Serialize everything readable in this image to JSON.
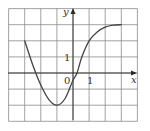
{
  "chart_data": {
    "type": "line",
    "title": "",
    "xlabel": "x",
    "ylabel": "y",
    "tick_labels": {
      "origin": "0",
      "x": [
        "1"
      ],
      "y": [
        "1"
      ]
    },
    "xlim": [
      -4,
      4
    ],
    "ylim": [
      -3,
      4
    ],
    "grid": true,
    "grid_step": 1,
    "legend": null,
    "series": [
      {
        "name": "f(x)",
        "x": [
          -3,
          -2.5,
          -2,
          -1.5,
          -1,
          -0.5,
          0,
          0.25,
          0.55,
          1,
          1.5,
          2,
          2.5,
          3
        ],
        "y": [
          2,
          0.5,
          -0.75,
          -1.65,
          -2,
          -1.6,
          -0.45,
          0,
          1,
          2,
          2.55,
          2.85,
          2.97,
          3
        ]
      }
    ]
  },
  "labels": {
    "x_axis": "x",
    "y_axis": "y",
    "origin": "0",
    "x_tick_1": "1",
    "y_tick_1": "1"
  }
}
